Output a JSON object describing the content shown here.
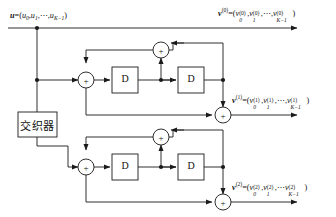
{
  "diagram": {
    "colors": {
      "line": "#1a1a1a",
      "text": "#111111",
      "background": "#ffffff"
    },
    "input": {
      "name": "input-sequence-label",
      "vector": "u",
      "equals": "=(",
      "terms": "u0,u1,⋯,uK−1",
      "close": ")"
    },
    "interleaver": {
      "label": "交织器"
    },
    "delay_label": "D",
    "adder_symbol": "+",
    "outputs": [
      {
        "name": "systematic-output-label",
        "vector": "v",
        "superscript": "(0)",
        "terms": "v0(0),v1(0),⋯,vK−1(0)"
      },
      {
        "name": "parity1-output-label",
        "vector": "v",
        "superscript": "(1)",
        "terms": "v0(1),v1(1),⋯,vK−1(1)"
      },
      {
        "name": "parity2-output-label",
        "vector": "v",
        "superscript": "(2)",
        "terms": "v0(2),v1(2),⋯,vK−1(2)"
      }
    ],
    "encoders": [
      {
        "name": "upper-rsc-encoder",
        "delays": [
          "D",
          "D"
        ],
        "adders": [
          "input-adder",
          "feedback-adder",
          "output-adder"
        ]
      },
      {
        "name": "lower-rsc-encoder",
        "delays": [
          "D",
          "D"
        ],
        "adders": [
          "input-adder",
          "feedback-adder",
          "output-adder"
        ]
      }
    ]
  }
}
